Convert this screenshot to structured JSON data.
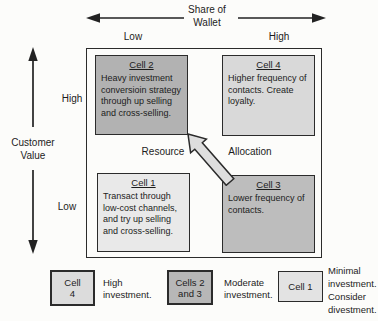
{
  "figure": {
    "top_axis": {
      "title": "Share of\nWallet",
      "low_label": "Low",
      "high_label": "High"
    },
    "left_axis": {
      "title": "Customer\nValue",
      "high_label": "High",
      "low_label": "Low"
    },
    "center": {
      "left_word": "Resource",
      "right_word": "Allocation"
    },
    "cells": {
      "cell2": {
        "title": "Cell 2",
        "body": "Heavy investment conversioin strategy through up selling and cross-selling."
      },
      "cell4": {
        "title": "Cell 4",
        "body": "Higher frequency of contacts. Create loyalty."
      },
      "cell1": {
        "title": "Cell 1",
        "body": "Transact through low-cost channels, and try up selling and cross-selling."
      },
      "cell3": {
        "title": "Cell 3",
        "body": "Lower frequency of contacts."
      }
    },
    "legend": {
      "item1": {
        "box": "Cell\n4",
        "label": "High\ninvestment."
      },
      "item2": {
        "box": "Cells 2\nand 3",
        "label": "Moderate\ninvestment."
      },
      "item3": {
        "box": "Cell 1",
        "label": "Minimal\ninvestment.\nConsider\ndivestment."
      }
    },
    "colors": {
      "cell2_fill": "#b2b2b2",
      "cell3_fill": "#bdbdbd",
      "cell4_fill": "#d9d9d9",
      "cell1_fill": "#e9e9e9",
      "legend_high_fill": "#dcdcdc",
      "legend_moderate_fill": "#b7b7b7",
      "legend_minimal_fill": "#e3e3e3",
      "arrow_fill": "#dedede",
      "line_color": "#222222"
    }
  }
}
